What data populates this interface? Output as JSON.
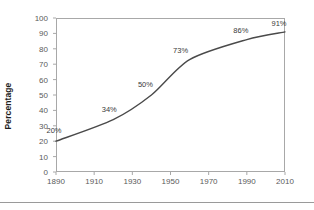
{
  "chart_data": {
    "type": "line",
    "title": "",
    "xlabel": "",
    "ylabel": "Percentage",
    "x": [
      1890,
      1920,
      1940,
      1960,
      1990,
      2010
    ],
    "values": [
      20,
      34,
      50,
      73,
      86,
      91
    ],
    "point_labels": [
      "20%",
      "34%",
      "50%",
      "73%",
      "86%",
      "91%"
    ],
    "xlim": [
      1890,
      2010
    ],
    "ylim": [
      0,
      100
    ],
    "x_tick_labels": [
      "1890",
      "1910",
      "1930",
      "1950",
      "1970",
      "1990",
      "2010"
    ],
    "x_ticks": [
      1890,
      1910,
      1930,
      1950,
      1970,
      1990,
      2010
    ],
    "y_tick_labels": [
      "0",
      "10",
      "20",
      "30",
      "40",
      "50",
      "60",
      "70",
      "80",
      "90",
      "100"
    ],
    "y_ticks": [
      0,
      10,
      20,
      30,
      40,
      50,
      60,
      70,
      80,
      90,
      100
    ],
    "grid": false,
    "legend": "none",
    "series_color": "#4a4a4a",
    "axis_color": "#a8a8a8",
    "tick_label_color": "#5a5a5a"
  },
  "axes": {
    "y_title": "Percentage"
  }
}
